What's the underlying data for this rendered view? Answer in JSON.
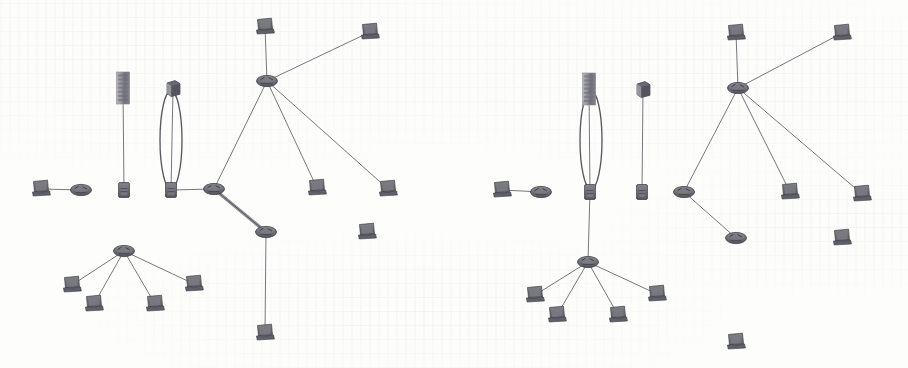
{
  "image": {
    "kind": "network-topology-diagram-pair",
    "background_color": "#fdfdfc",
    "ink_color": "#5a5a60",
    "node_fill": "#6e6e74",
    "node_stroke": "#3c3c42",
    "link_color": "#6b6b72",
    "highlight_link_color": "#8a8a90",
    "annotation_color": "#4a4a52",
    "width": 908,
    "height": 368,
    "caption": "",
    "panels_count": 2
  },
  "panels": [
    {
      "id": "panel-left",
      "name": "left-network-diagram",
      "origin_x": 0,
      "origin_y": 0,
      "annotation": {
        "shape": "ellipse",
        "name": "highlight-ellipse",
        "cx": 171,
        "cy": 140,
        "rx": 11,
        "ry": 49,
        "encircles": "link-switch-b-to-cube-node",
        "stroke": "#4a4a52"
      },
      "highlighted_link": {
        "from": "router-core",
        "to": "router-south",
        "style": "thick"
      },
      "nodes": [
        {
          "id": "pc-west",
          "type": "workstation",
          "name": "workstation-west",
          "x": 41,
          "y": 189
        },
        {
          "id": "router-west",
          "type": "router",
          "name": "router-west",
          "x": 81,
          "y": 190
        },
        {
          "id": "switch-a",
          "type": "switch",
          "name": "switch-a",
          "x": 124,
          "y": 190
        },
        {
          "id": "tower-a",
          "type": "server-tower",
          "name": "server-tower-a",
          "x": 123,
          "y": 88
        },
        {
          "id": "switch-b",
          "type": "switch",
          "name": "switch-b",
          "x": 171,
          "y": 190
        },
        {
          "id": "cube-a",
          "type": "device-cube",
          "name": "device-cube-a",
          "x": 173,
          "y": 90
        },
        {
          "id": "router-core",
          "type": "router",
          "name": "router-core",
          "x": 214,
          "y": 189
        },
        {
          "id": "router-north",
          "type": "router",
          "name": "router-north",
          "x": 267,
          "y": 81
        },
        {
          "id": "pc-n1",
          "type": "workstation",
          "name": "workstation-north-1",
          "x": 265,
          "y": 27
        },
        {
          "id": "pc-n2",
          "type": "workstation",
          "name": "workstation-north-2",
          "x": 370,
          "y": 32
        },
        {
          "id": "pc-n3",
          "type": "workstation",
          "name": "workstation-north-3",
          "x": 317,
          "y": 188
        },
        {
          "id": "pc-n4",
          "type": "workstation",
          "name": "workstation-north-4",
          "x": 388,
          "y": 189
        },
        {
          "id": "router-south",
          "type": "router",
          "name": "router-south",
          "x": 266,
          "y": 232
        },
        {
          "id": "pc-s1",
          "type": "workstation",
          "name": "workstation-south-east",
          "x": 367,
          "y": 232
        },
        {
          "id": "pc-s2",
          "type": "workstation",
          "name": "workstation-south-low",
          "x": 265,
          "y": 333
        },
        {
          "id": "router-fan",
          "type": "router",
          "name": "router-fan-bottom",
          "x": 124,
          "y": 251
        },
        {
          "id": "pc-f1",
          "type": "workstation",
          "name": "workstation-fan-1",
          "x": 72,
          "y": 285
        },
        {
          "id": "pc-f2",
          "type": "workstation",
          "name": "workstation-fan-2",
          "x": 94,
          "y": 304
        },
        {
          "id": "pc-f3",
          "type": "workstation",
          "name": "workstation-fan-3",
          "x": 155,
          "y": 304
        },
        {
          "id": "pc-f4",
          "type": "workstation",
          "name": "workstation-fan-4",
          "x": 194,
          "y": 284
        }
      ],
      "links": [
        {
          "from": "pc-west",
          "to": "router-west",
          "name": "link-pc-west-router-west"
        },
        {
          "from": "router-west",
          "to": "switch-a",
          "name": "link-router-west-switch-a"
        },
        {
          "from": "switch-a",
          "to": "switch-b",
          "name": "link-switch-a-switch-b"
        },
        {
          "from": "switch-b",
          "to": "router-core",
          "name": "link-switch-b-router-core"
        },
        {
          "from": "switch-a",
          "to": "tower-a",
          "name": "link-switch-a-tower-a"
        },
        {
          "from": "switch-b",
          "to": "cube-a",
          "name": "link-switch-b-cube-a"
        },
        {
          "from": "switch-a",
          "to": "router-fan",
          "name": "link-switch-a-router-fan"
        },
        {
          "from": "router-fan",
          "to": "pc-f1",
          "name": "link-router-fan-pc-f1"
        },
        {
          "from": "router-fan",
          "to": "pc-f2",
          "name": "link-router-fan-pc-f2"
        },
        {
          "from": "router-fan",
          "to": "pc-f3",
          "name": "link-router-fan-pc-f3"
        },
        {
          "from": "router-fan",
          "to": "pc-f4",
          "name": "link-router-fan-pc-f4"
        },
        {
          "from": "router-core",
          "to": "router-north",
          "name": "link-router-core-router-north"
        },
        {
          "from": "router-core",
          "to": "router-south",
          "name": "link-router-core-router-south",
          "thick": true
        },
        {
          "from": "router-north",
          "to": "pc-n1",
          "name": "link-router-north-pc-n1"
        },
        {
          "from": "router-north",
          "to": "pc-n2",
          "name": "link-router-north-pc-n2"
        },
        {
          "from": "router-north",
          "to": "pc-n3",
          "name": "link-router-north-pc-n3"
        },
        {
          "from": "router-north",
          "to": "pc-n4",
          "name": "link-router-north-pc-n4"
        },
        {
          "from": "router-south",
          "to": "pc-s1",
          "name": "link-router-south-pc-s1"
        },
        {
          "from": "router-south",
          "to": "pc-s2",
          "name": "link-router-south-pc-s2"
        }
      ]
    },
    {
      "id": "panel-right",
      "name": "right-network-diagram",
      "origin_x": 454,
      "origin_y": 0,
      "annotation": {
        "shape": "ellipse",
        "name": "highlight-ellipse",
        "cx": 591,
        "cy": 140,
        "rx": 11,
        "ry": 49,
        "encircles": "link-switch-a-to-server-tower",
        "stroke": "#4a4a52"
      },
      "highlighted_link": null,
      "nodes": [
        {
          "id": "pc-west",
          "type": "workstation",
          "name": "workstation-west",
          "x": 502,
          "y": 190
        },
        {
          "id": "router-west",
          "type": "router",
          "name": "router-west",
          "x": 541,
          "y": 192
        },
        {
          "id": "switch-a",
          "type": "switch",
          "name": "switch-a",
          "x": 590,
          "y": 192
        },
        {
          "id": "tower-a",
          "type": "server-tower",
          "name": "server-tower-a",
          "x": 589,
          "y": 89
        },
        {
          "id": "switch-b",
          "type": "switch",
          "name": "switch-b",
          "x": 642,
          "y": 192
        },
        {
          "id": "cube-a",
          "type": "device-cube",
          "name": "device-cube-a",
          "x": 643,
          "y": 91
        },
        {
          "id": "router-core",
          "type": "router",
          "name": "router-core",
          "x": 684,
          "y": 192
        },
        {
          "id": "router-north",
          "type": "router",
          "name": "router-north",
          "x": 738,
          "y": 88
        },
        {
          "id": "pc-n1",
          "type": "workstation",
          "name": "workstation-north-1",
          "x": 736,
          "y": 33
        },
        {
          "id": "pc-n2",
          "type": "workstation",
          "name": "workstation-north-2",
          "x": 842,
          "y": 33
        },
        {
          "id": "pc-n3",
          "type": "workstation",
          "name": "workstation-north-3",
          "x": 790,
          "y": 192
        },
        {
          "id": "pc-n4",
          "type": "workstation",
          "name": "workstation-north-4",
          "x": 862,
          "y": 194
        },
        {
          "id": "router-south",
          "type": "router",
          "name": "router-south",
          "x": 736,
          "y": 238
        },
        {
          "id": "pc-s1",
          "type": "workstation",
          "name": "workstation-south-east",
          "x": 842,
          "y": 238
        },
        {
          "id": "pc-s2",
          "type": "workstation",
          "name": "workstation-south-low",
          "x": 736,
          "y": 342
        },
        {
          "id": "router-fan",
          "type": "router",
          "name": "router-fan-bottom",
          "x": 588,
          "y": 262
        },
        {
          "id": "pc-f1",
          "type": "workstation",
          "name": "workstation-fan-1",
          "x": 535,
          "y": 295
        },
        {
          "id": "pc-f2",
          "type": "workstation",
          "name": "workstation-fan-2",
          "x": 557,
          "y": 315
        },
        {
          "id": "pc-f3",
          "type": "workstation",
          "name": "workstation-fan-3",
          "x": 618,
          "y": 315
        },
        {
          "id": "pc-f4",
          "type": "workstation",
          "name": "workstation-fan-4",
          "x": 657,
          "y": 294
        }
      ],
      "links": [
        {
          "from": "pc-west",
          "to": "router-west",
          "name": "link-pc-west-router-west"
        },
        {
          "from": "router-west",
          "to": "switch-a",
          "name": "link-router-west-switch-a"
        },
        {
          "from": "switch-a",
          "to": "switch-b",
          "name": "link-switch-a-switch-b"
        },
        {
          "from": "switch-b",
          "to": "router-core",
          "name": "link-switch-b-router-core"
        },
        {
          "from": "switch-a",
          "to": "tower-a",
          "name": "link-switch-a-tower-a"
        },
        {
          "from": "switch-b",
          "to": "cube-a",
          "name": "link-switch-b-cube-a"
        },
        {
          "from": "switch-a",
          "to": "router-fan",
          "name": "link-switch-a-router-fan"
        },
        {
          "from": "router-fan",
          "to": "pc-f1",
          "name": "link-router-fan-pc-f1"
        },
        {
          "from": "router-fan",
          "to": "pc-f2",
          "name": "link-router-fan-pc-f2"
        },
        {
          "from": "router-fan",
          "to": "pc-f3",
          "name": "link-router-fan-pc-f3"
        },
        {
          "from": "router-fan",
          "to": "pc-f4",
          "name": "link-router-fan-pc-f4"
        },
        {
          "from": "router-core",
          "to": "router-north",
          "name": "link-router-core-router-north"
        },
        {
          "from": "router-core",
          "to": "router-south",
          "name": "link-router-core-router-south"
        },
        {
          "from": "router-north",
          "to": "pc-n1",
          "name": "link-router-north-pc-n1"
        },
        {
          "from": "router-north",
          "to": "pc-n2",
          "name": "link-router-north-pc-n2"
        },
        {
          "from": "router-north",
          "to": "pc-n3",
          "name": "link-router-north-pc-n3"
        },
        {
          "from": "router-north",
          "to": "pc-n4",
          "name": "link-router-north-pc-n4"
        },
        {
          "from": "router-south",
          "to": "pc-s1",
          "name": "link-router-south-pc-s1"
        },
        {
          "from": "router-south",
          "to": "pc-s2",
          "name": "link-router-south-pc-s2"
        }
      ]
    }
  ]
}
